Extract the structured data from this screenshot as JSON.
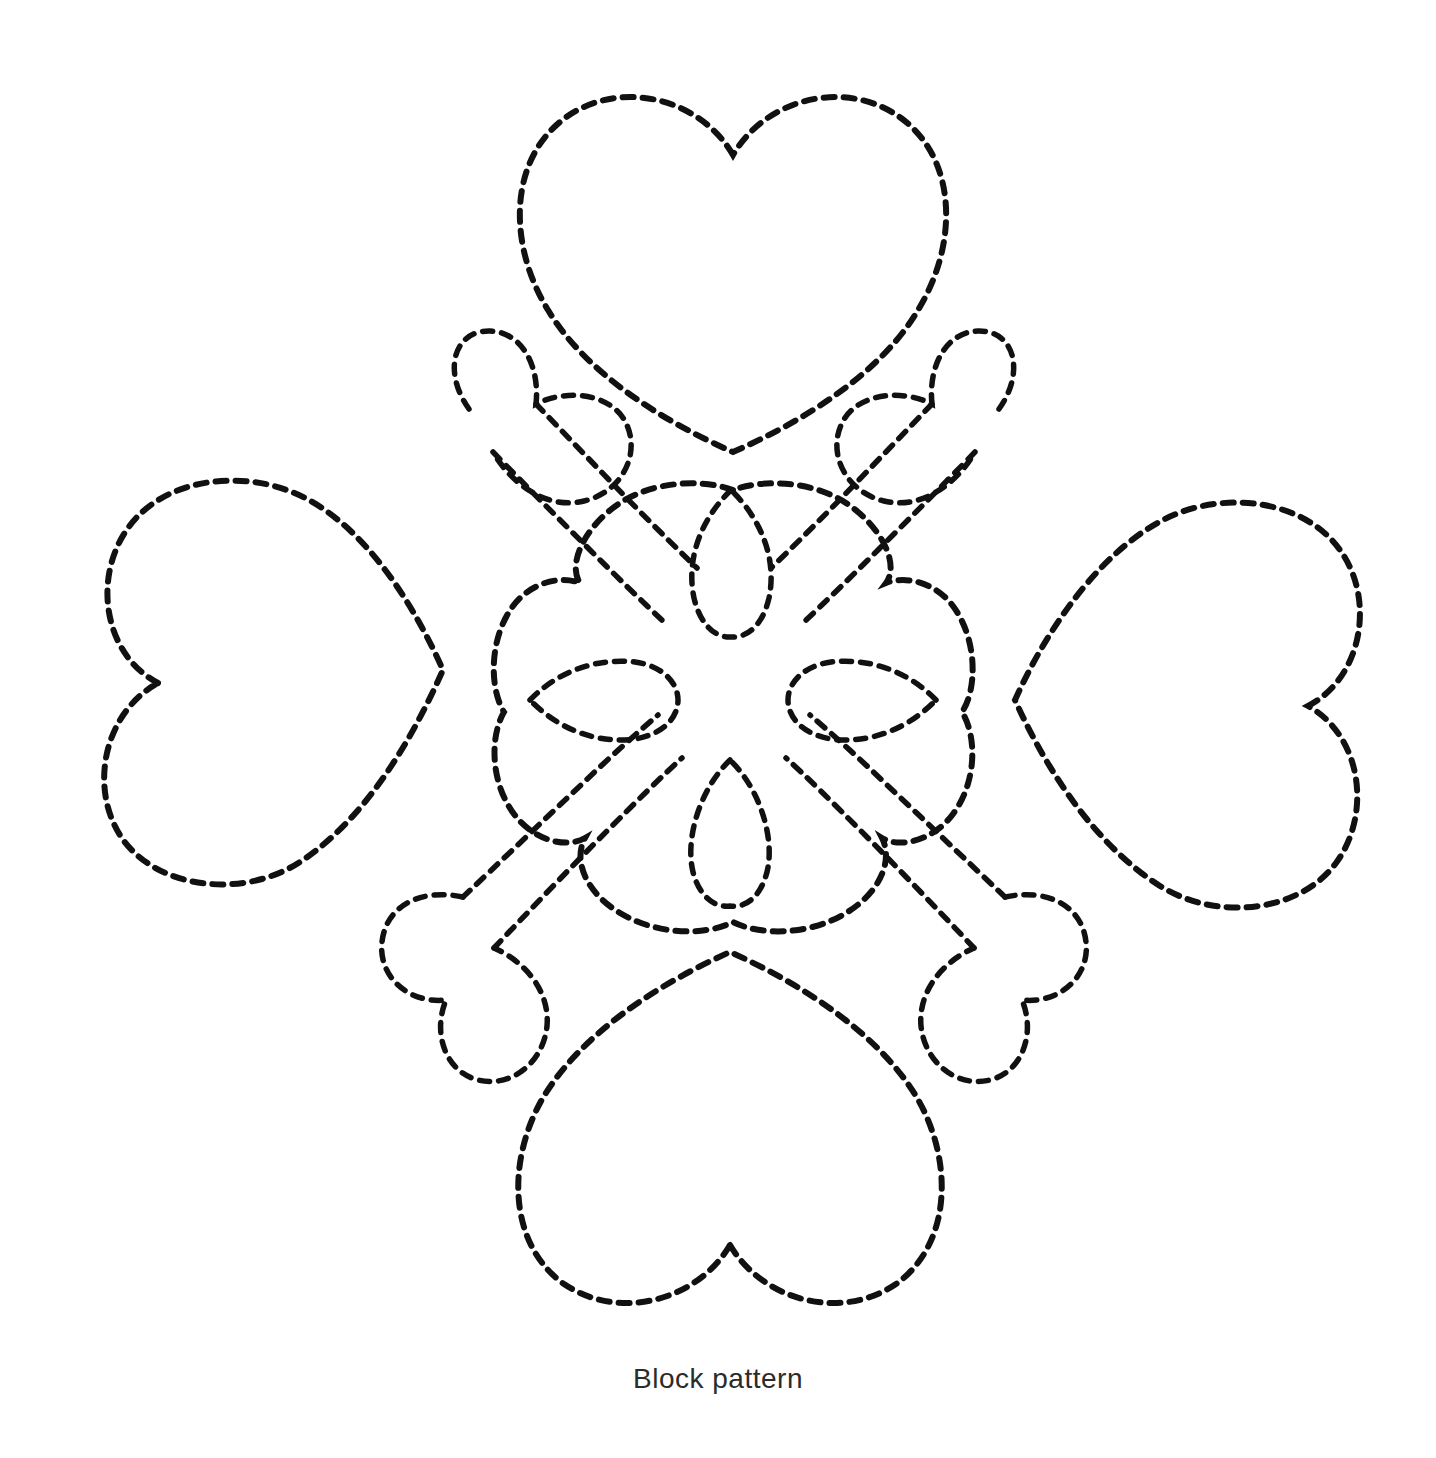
{
  "document": {
    "title": "Block pattern",
    "background_color": "#ffffff",
    "stitch_color": "#111111",
    "caption_color": "#2b2b2b",
    "width": 1436,
    "height": 1458
  },
  "caption": {
    "text": "Block pattern"
  },
  "diagram": {
    "name": "quilting-block-pattern",
    "line_style": "dashed stitch line",
    "dash_length_px": 11,
    "dash_gap_px": 9,
    "stroke_width_px": 6,
    "shapes": [
      {
        "id": "heart-top",
        "label": "Top heart",
        "rotation_deg": 0,
        "center": [
          733,
          270
        ],
        "width": 435,
        "height": 365
      },
      {
        "id": "heart-left",
        "label": "Left heart",
        "rotation_deg": 270,
        "center": [
          290,
          685
        ],
        "width": 400,
        "height": 420
      },
      {
        "id": "heart-right",
        "label": "Right heart",
        "rotation_deg": 90,
        "center": [
          1160,
          705
        ],
        "width": 400,
        "height": 420
      },
      {
        "id": "heart-bottom",
        "label": "Bottom heart",
        "rotation_deg": 180,
        "center": [
          730,
          1130
        ],
        "width": 430,
        "height": 365
      },
      {
        "id": "heart-diag-top-left",
        "label": "Upper-left diagonal heart",
        "rotation_deg": 315,
        "center": [
          495,
          475
        ]
      },
      {
        "id": "heart-diag-top-right",
        "label": "Upper-right diagonal heart",
        "rotation_deg": 45,
        "center": [
          975,
          475
        ]
      },
      {
        "id": "heart-diag-bottom-left",
        "label": "Lower-left diagonal heart",
        "rotation_deg": 225,
        "center": [
          490,
          940
        ]
      },
      {
        "id": "heart-diag-bottom-right",
        "label": "Lower-right diagonal heart",
        "rotation_deg": 135,
        "center": [
          980,
          940
        ]
      },
      {
        "id": "flower-center",
        "label": "Central four-petal flower",
        "center": [
          733,
          705
        ],
        "width": 450,
        "height": 420
      },
      {
        "id": "petal-top",
        "label": "Top inner petal",
        "center": [
          731,
          562
        ],
        "width": 80,
        "height": 145
      },
      {
        "id": "petal-bottom",
        "label": "Bottom inner petal",
        "center": [
          730,
          832
        ],
        "width": 80,
        "height": 145
      },
      {
        "id": "petal-left",
        "label": "Left inner petal",
        "center": [
          604,
          700
        ],
        "width": 148,
        "height": 86
      },
      {
        "id": "petal-right",
        "label": "Right inner petal",
        "center": [
          862,
          700
        ],
        "width": 148,
        "height": 86
      }
    ]
  }
}
